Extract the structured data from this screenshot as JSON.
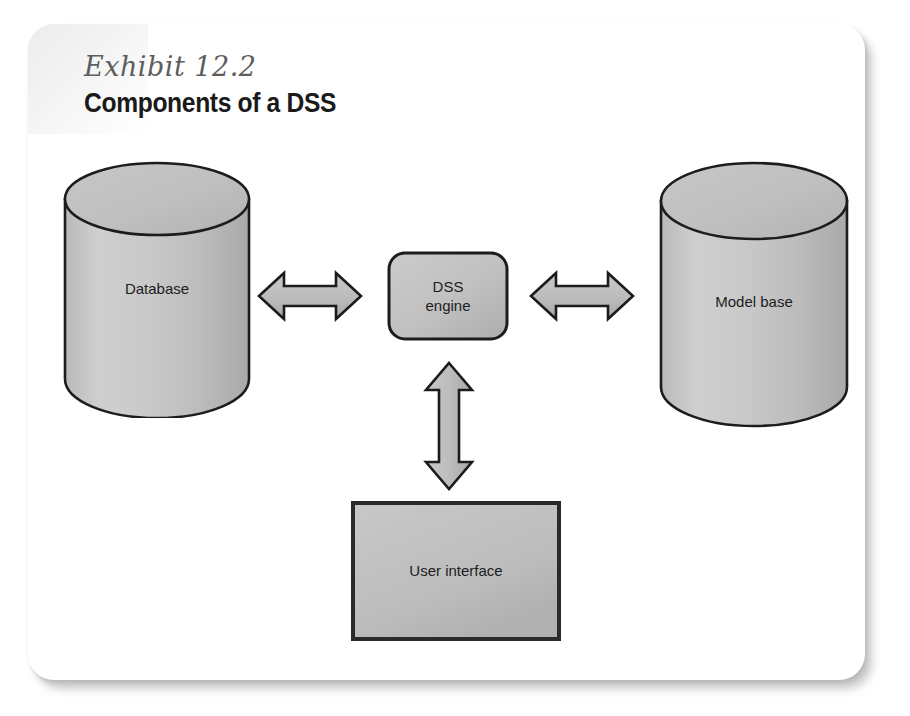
{
  "exhibit": {
    "label": "Exhibit 12.2",
    "title": "Components of a DSS"
  },
  "diagram": {
    "type": "block-diagram",
    "nodes": [
      {
        "id": "database",
        "shape": "cylinder",
        "label": "Database"
      },
      {
        "id": "dss-engine",
        "shape": "rounded-rect",
        "label": "DSS\nengine"
      },
      {
        "id": "model-base",
        "shape": "cylinder",
        "label": "Model base"
      },
      {
        "id": "user-interface",
        "shape": "rect",
        "label": "User interface"
      }
    ],
    "connectors": [
      {
        "id": "database-to-engine",
        "from": "database",
        "to": "dss-engine",
        "style": "double-arrow",
        "orientation": "horizontal"
      },
      {
        "id": "engine-to-modelbase",
        "from": "dss-engine",
        "to": "model-base",
        "style": "double-arrow",
        "orientation": "horizontal"
      },
      {
        "id": "engine-to-ui",
        "from": "dss-engine",
        "to": "user-interface",
        "style": "double-arrow",
        "orientation": "vertical"
      }
    ]
  },
  "colors": {
    "shape_fill_light": "#cfcfcf",
    "shape_fill_dark": "#a8a8a8",
    "outline": "#1c1c1c",
    "card_background": "#ffffff",
    "label_text": "#1d1d1d",
    "exhibit_label_text": "#5d5d5d"
  }
}
